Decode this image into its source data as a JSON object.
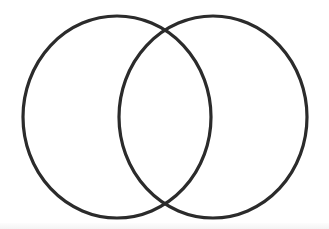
{
  "figure": {
    "kind": "venn-two-set",
    "width": 329,
    "height": 229,
    "background_color": "#ffffff",
    "stroke_color": "#2b2b2b",
    "stroke_width": 3.2,
    "fill": "none",
    "label_text": "",
    "circles": [
      {
        "name": "left-circle",
        "cx": 117,
        "cy": 117,
        "rx": 94,
        "ry": 101,
        "stroke_color": "#2b2b2b",
        "stroke_width": 3.2
      },
      {
        "name": "right-circle",
        "cx": 213,
        "cy": 117,
        "rx": 94,
        "ry": 101,
        "stroke_color": "#2b2b2b",
        "stroke_width": 3.2
      }
    ],
    "intersections": [
      {
        "name": "top-intersection",
        "x": 165,
        "y": 30
      },
      {
        "name": "bottom-intersection",
        "x": 166,
        "y": 203
      }
    ],
    "regions": [
      {
        "name": "left-only-region",
        "label": ""
      },
      {
        "name": "overlap-region",
        "label": ""
      },
      {
        "name": "right-only-region",
        "label": ""
      }
    ],
    "artifacts": {
      "left_edge_shade": "#ededed",
      "bottom_edge_shade": "#f4f4f4"
    }
  }
}
